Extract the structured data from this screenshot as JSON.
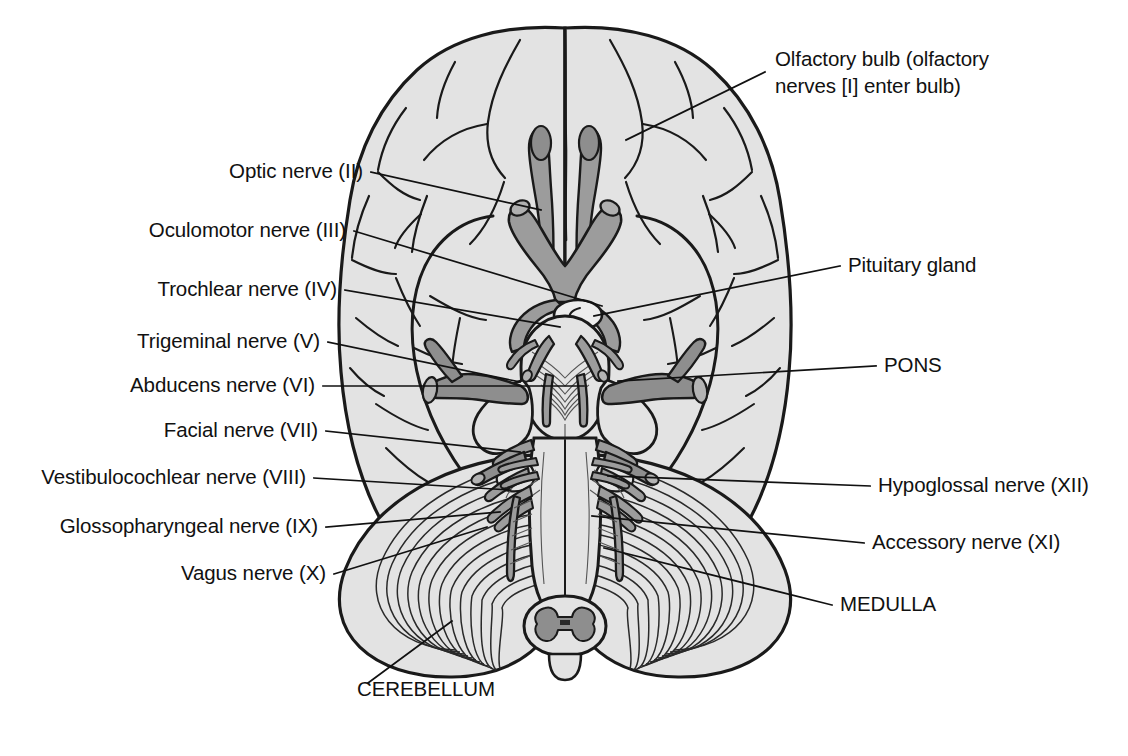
{
  "figure": {
    "view": "inferior surface of brain and brainstem",
    "colors": {
      "cerebrum_fill": "#e3e3e3",
      "nerve_fill": "#9c9c9c",
      "outline": "#1a1a1a",
      "background": "#ffffff",
      "label_text": "#111111"
    }
  },
  "labels": {
    "left": [
      {
        "id": "optic",
        "text": "Optic nerve (II)",
        "x": 363,
        "y": 178,
        "anchor": "end"
      },
      {
        "id": "oculomotor",
        "text": "Oculomotor nerve (III)",
        "x": 346,
        "y": 237,
        "anchor": "end"
      },
      {
        "id": "trochlear",
        "text": "Trochlear nerve (IV)",
        "x": 337,
        "y": 296,
        "anchor": "end"
      },
      {
        "id": "trigeminal",
        "text": "Trigeminal nerve (V)",
        "x": 320,
        "y": 348,
        "anchor": "end"
      },
      {
        "id": "abducens",
        "text": "Abducens nerve (VI)",
        "x": 315,
        "y": 392,
        "anchor": "end"
      },
      {
        "id": "facial",
        "text": "Facial nerve (VII)",
        "x": 318,
        "y": 437,
        "anchor": "end"
      },
      {
        "id": "vestibulocochlear",
        "text": "Vestibulocochlear nerve (VIII)",
        "x": 306,
        "y": 484,
        "anchor": "end"
      },
      {
        "id": "glossopharyngeal",
        "text": "Glossopharyngeal nerve (IX)",
        "x": 318,
        "y": 533,
        "anchor": "end"
      },
      {
        "id": "vagus",
        "text": "Vagus nerve (X)",
        "x": 326,
        "y": 580,
        "anchor": "end"
      }
    ],
    "right": [
      {
        "id": "olfactory_line1",
        "text": "Olfactory bulb (olfactory",
        "x": 775,
        "y": 66,
        "anchor": "start"
      },
      {
        "id": "olfactory_line2",
        "text": "nerves [I] enter bulb)",
        "x": 775,
        "y": 93,
        "anchor": "start"
      },
      {
        "id": "pituitary",
        "text": "Pituitary gland",
        "x": 848,
        "y": 272,
        "anchor": "start"
      },
      {
        "id": "pons",
        "text": "PONS",
        "x": 884,
        "y": 372,
        "anchor": "start"
      },
      {
        "id": "hypoglossal",
        "text": "Hypoglossal nerve (XII)",
        "x": 878,
        "y": 492,
        "anchor": "start"
      },
      {
        "id": "accessory",
        "text": "Accessory nerve (XI)",
        "x": 872,
        "y": 549,
        "anchor": "start"
      },
      {
        "id": "medulla",
        "text": "MEDULLA",
        "x": 840,
        "y": 611,
        "anchor": "start"
      }
    ],
    "bottom": [
      {
        "id": "cerebellum",
        "text": "CEREBELLUM",
        "x": 357,
        "y": 696,
        "anchor": "start"
      }
    ]
  },
  "leaders": {
    "optic": "M371,172 L541,210",
    "oculomotor": "M354,231 L602,306",
    "trochlear": "M345,290 L560,327",
    "trigeminal": "M328,342 L520,382",
    "abducens": "M323,386 L584,386",
    "facial": "M326,431 L520,452",
    "vestibulocochlear": "M314,478 L510,490",
    "glossopharyngeal": "M326,527 L500,512",
    "vagus": "M334,574 L487,527",
    "olfactory": "M765,72 L626,140",
    "pituitary": "M840,266 L594,316",
    "pons": "M876,366 L618,381",
    "hypoglossal": "M870,486 L608,476",
    "accessory": "M864,543 L592,516",
    "medulla": "M832,605 L604,548",
    "cerebellum": "M368,683 L452,621"
  },
  "anatomy": {
    "structures": [
      "frontal lobe",
      "temporal lobe",
      "occipital lobe",
      "longitudinal fissure",
      "olfactory bulb",
      "olfactory tract",
      "optic nerve",
      "optic chiasm",
      "optic tract",
      "pituitary gland (infundibulum)",
      "mammillary bodies",
      "midbrain / cerebral peduncle",
      "pons",
      "middle cerebellar peduncle",
      "medulla oblongata",
      "pyramids",
      "olive",
      "cerebellar hemisphere (folia)",
      "spinal cord"
    ],
    "cranial_nerves": [
      {
        "numeral": "I",
        "name": "Olfactory"
      },
      {
        "numeral": "II",
        "name": "Optic"
      },
      {
        "numeral": "III",
        "name": "Oculomotor"
      },
      {
        "numeral": "IV",
        "name": "Trochlear"
      },
      {
        "numeral": "V",
        "name": "Trigeminal"
      },
      {
        "numeral": "VI",
        "name": "Abducens"
      },
      {
        "numeral": "VII",
        "name": "Facial"
      },
      {
        "numeral": "VIII",
        "name": "Vestibulocochlear"
      },
      {
        "numeral": "IX",
        "name": "Glossopharyngeal"
      },
      {
        "numeral": "X",
        "name": "Vagus"
      },
      {
        "numeral": "XI",
        "name": "Accessory"
      },
      {
        "numeral": "XII",
        "name": "Hypoglossal"
      }
    ]
  }
}
